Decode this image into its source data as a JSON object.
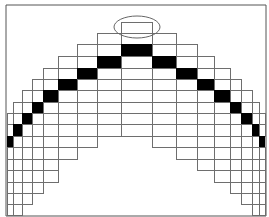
{
  "figure": {
    "frame": {
      "left": 6,
      "top": 5,
      "right": 266,
      "bottom": 216
    },
    "row_lines": [
      22,
      33,
      44,
      56,
      68,
      79,
      90,
      102,
      113,
      124,
      136,
      147,
      159,
      170,
      182,
      193,
      204,
      215
    ],
    "columns": [
      {
        "x0": 7,
        "x1": 13,
        "top": 113,
        "black_top": 136,
        "black_bottom": 147,
        "bottom": 215
      },
      {
        "x0": 13,
        "x1": 22,
        "top": 102,
        "black_top": 124,
        "black_bottom": 136,
        "bottom": 215
      },
      {
        "x0": 22,
        "x1": 32,
        "top": 90,
        "black_top": 113,
        "black_bottom": 124,
        "bottom": 204
      },
      {
        "x0": 32,
        "x1": 43,
        "top": 79,
        "black_top": 102,
        "black_bottom": 113,
        "bottom": 193
      },
      {
        "x0": 43,
        "x1": 58,
        "top": 68,
        "black_top": 90,
        "black_bottom": 102,
        "bottom": 182
      },
      {
        "x0": 58,
        "x1": 77,
        "top": 56,
        "black_top": 79,
        "black_bottom": 90,
        "bottom": 159
      },
      {
        "x0": 77,
        "x1": 97,
        "top": 44,
        "black_top": 68,
        "black_bottom": 79,
        "bottom": 147
      },
      {
        "x0": 97,
        "x1": 121,
        "top": 33,
        "black_top": 56,
        "black_bottom": 68,
        "bottom": 136
      },
      {
        "x0": 121,
        "x1": 152,
        "top": 22,
        "black_top": 44,
        "black_bottom": 56,
        "bottom": 136
      },
      {
        "x0": 152,
        "x1": 176,
        "top": 33,
        "black_top": 56,
        "black_bottom": 68,
        "bottom": 147
      },
      {
        "x0": 176,
        "x1": 197,
        "top": 44,
        "black_top": 68,
        "black_bottom": 79,
        "bottom": 159
      },
      {
        "x0": 197,
        "x1": 214,
        "top": 56,
        "black_top": 79,
        "black_bottom": 90,
        "bottom": 170
      },
      {
        "x0": 214,
        "x1": 230,
        "top": 68,
        "black_top": 90,
        "black_bottom": 102,
        "bottom": 182
      },
      {
        "x0": 230,
        "x1": 241,
        "top": 79,
        "black_top": 102,
        "black_bottom": 113,
        "bottom": 193
      },
      {
        "x0": 241,
        "x1": 252,
        "top": 90,
        "black_top": 113,
        "black_bottom": 124,
        "bottom": 204
      },
      {
        "x0": 252,
        "x1": 259,
        "top": 102,
        "black_top": 124,
        "black_bottom": 136,
        "bottom": 215
      },
      {
        "x0": 259,
        "x1": 265,
        "top": 113,
        "black_top": 136,
        "black_bottom": 147,
        "bottom": 215
      }
    ],
    "highlight_ellipse": {
      "cx": 137,
      "cy": 27,
      "rx": 23,
      "ry": 11
    },
    "colors": {
      "background": "#ffffff",
      "grid_line": "#6e6e6e",
      "frame_line": "#555555",
      "filled_cell": "#000000",
      "ellipse_stroke": "#666666"
    }
  }
}
